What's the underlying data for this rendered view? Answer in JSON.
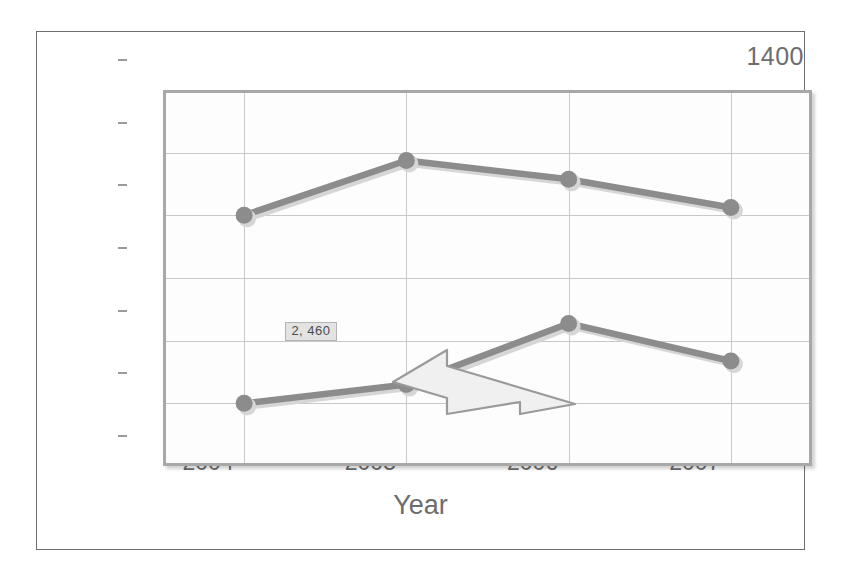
{
  "chart_data": {
    "type": "line",
    "title": "",
    "subtitle": "",
    "xlabel": "Year",
    "ylabel": "",
    "categories": [
      "2004",
      "2005",
      "2006",
      "2007"
    ],
    "x": [
      2004,
      2005,
      2006,
      2007
    ],
    "series": [
      {
        "name": "Series 1",
        "values": [
          1000,
          1175,
          1115,
          1025
        ],
        "color": "#8c8c8c"
      },
      {
        "name": "Series 2",
        "values": [
          400,
          460,
          655,
          535
        ],
        "color": "#8c8c8c"
      }
    ],
    "ylim": [
      200,
      1400
    ],
    "ytick_labels": [
      "200",
      "400",
      "600",
      "800",
      "1000",
      "1200",
      "1400"
    ],
    "ytick_values": [
      200,
      400,
      600,
      800,
      1000,
      1200,
      1400
    ],
    "xtick_labels": [
      "2004",
      "2005",
      "2006",
      "2007"
    ],
    "grid": "both",
    "legend": "none",
    "annotations": [
      {
        "name": "data-tooltip",
        "text": "2, 460",
        "x": 2005,
        "y": 460
      }
    ]
  },
  "axes": {
    "x_axis_title": "Year",
    "y_axis_title": ""
  },
  "cursor": {
    "name": "arrow-pointer",
    "direction": "left"
  }
}
